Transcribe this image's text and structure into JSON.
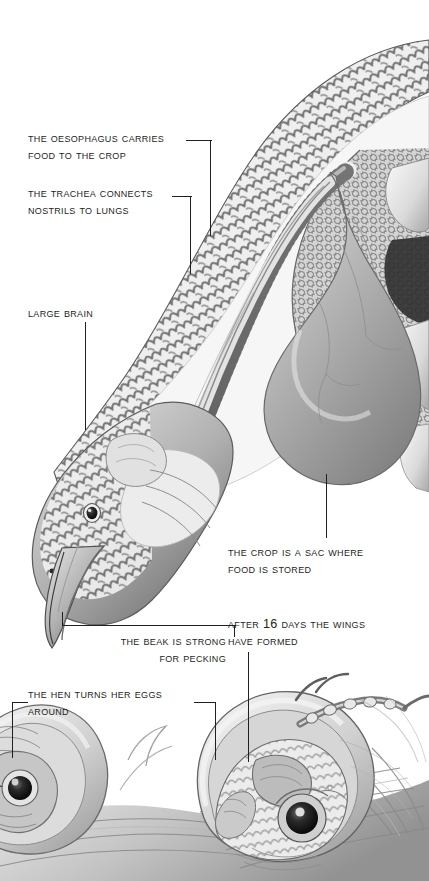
{
  "figure": {
    "palette": {
      "ink": "#231f20",
      "paper": "#ffffff",
      "mid_gray": "#9a9a9a",
      "dark_gray": "#4a4a4a",
      "light_gray": "#d8d8d8"
    }
  },
  "callouts": [
    {
      "id": "oesophagus",
      "line1": "The oesophagus carries",
      "line2": "food to the crop",
      "align": "left"
    },
    {
      "id": "trachea",
      "line1": "The trachea connects",
      "line2": "nostrils to lungs",
      "align": "left"
    },
    {
      "id": "brain",
      "line1": "Large brain",
      "line2": "",
      "align": "left"
    },
    {
      "id": "crop",
      "line1": "The crop is a sac where",
      "line2": "food is stored",
      "align": "left"
    },
    {
      "id": "beak",
      "line1": "The beak is strong",
      "line2": "for pecking",
      "align": "right"
    },
    {
      "id": "wings",
      "line1": "After 16 days the wings",
      "line2": "have formed",
      "align": "left"
    },
    {
      "id": "hen-turns-eggs",
      "line1": "The hen turns her eggs",
      "line2": "around",
      "align": "left"
    }
  ]
}
